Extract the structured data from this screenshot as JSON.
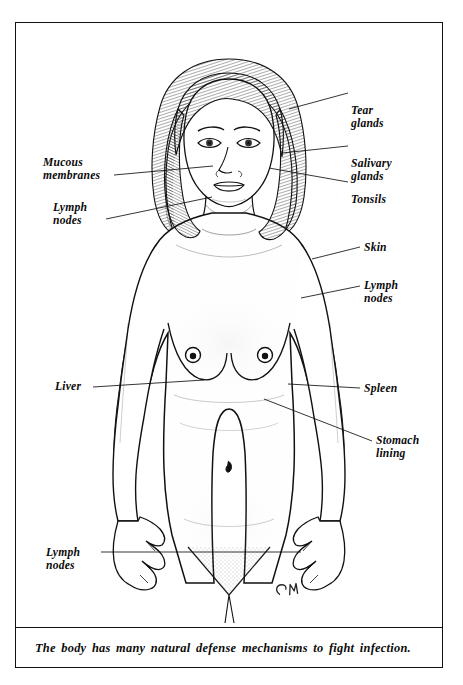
{
  "illustration": {
    "title": "Human body natural defense mechanisms",
    "subject": "female-torso-front-view",
    "signature": "CM",
    "caption": "The body has many natural defense mechanisms to fight infection.",
    "line_color": "#111111",
    "background_color": "#ffffff",
    "skin_shading_color": "#d9d9d9"
  },
  "labels_right": [
    {
      "id": "tear-glands",
      "text": "Tear\nglands",
      "x": 350,
      "y": 85,
      "leader": {
        "x1": 347,
        "y1": 92,
        "x2": 288,
        "y2": 108
      }
    },
    {
      "id": "salivary-glands",
      "text": "Salivary\nglands",
      "x": 350,
      "y": 130,
      "leader": {
        "x1": 347,
        "y1": 145,
        "x2": 281,
        "y2": 152
      }
    },
    {
      "id": "tonsils",
      "text": "Tonsils",
      "x": 350,
      "y": 177,
      "leader": {
        "x1": 347,
        "y1": 181,
        "x2": 268,
        "y2": 167
      }
    },
    {
      "id": "skin",
      "text": "Skin",
      "x": 363,
      "y": 242,
      "leader": {
        "x1": 359,
        "y1": 246,
        "x2": 311,
        "y2": 258
      }
    },
    {
      "id": "lymph-nodes-right",
      "text": "Lymph\nnodes",
      "x": 363,
      "y": 278,
      "leader": {
        "x1": 359,
        "y1": 285,
        "x2": 300,
        "y2": 297
      }
    },
    {
      "id": "spleen",
      "text": "Spleen",
      "x": 363,
      "y": 382,
      "leader": {
        "x1": 359,
        "y1": 387,
        "x2": 287,
        "y2": 383
      }
    },
    {
      "id": "stomach-lining",
      "text": "Stomach\nlining",
      "x": 375,
      "y": 433,
      "leader": {
        "x1": 371,
        "y1": 440,
        "x2": 263,
        "y2": 398
      }
    }
  ],
  "labels_left": [
    {
      "id": "mucous-membranes",
      "text": "Mucous\nmembranes",
      "x": 42,
      "y": 157,
      "leader": {
        "x1": 113,
        "y1": 174,
        "x2": 212,
        "y2": 165
      }
    },
    {
      "id": "lymph-nodes-neck",
      "text": "Lymph\nnodes",
      "x": 52,
      "y": 202,
      "leader": {
        "x1": 105,
        "y1": 218,
        "x2": 211,
        "y2": 196
      }
    },
    {
      "id": "liver",
      "text": "Liver",
      "x": 54,
      "y": 381,
      "leader": {
        "x1": 92,
        "y1": 386,
        "x2": 203,
        "y2": 379
      }
    },
    {
      "id": "lymph-nodes-groin",
      "text": "Lymph\nnodes",
      "x": 45,
      "y": 548,
      "leader": {
        "x1": 100,
        "y1": 551,
        "x2": 300,
        "y2": 551
      }
    }
  ],
  "frame": {
    "border_color": "#111111",
    "caption_divider": true
  }
}
